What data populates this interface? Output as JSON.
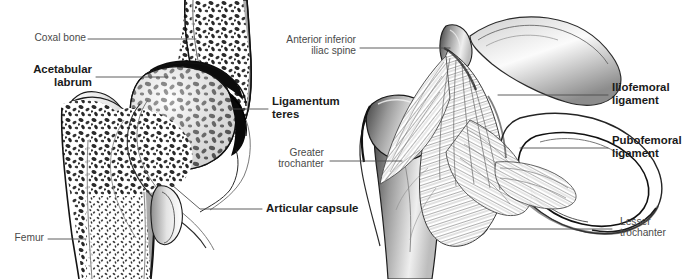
{
  "figure": {
    "background_color": "#ffffff",
    "ink_color": "#231f20",
    "leader_color": "#5a5a5a",
    "panels": [
      {
        "name": "coronal-section",
        "caption": "Coronal section through the hip joint showing trabecular bone"
      },
      {
        "name": "anterior-view",
        "caption": "Anterior view of the hip joint showing capsular ligaments"
      }
    ]
  },
  "labels": {
    "coxal_bone": "Coxal bone",
    "acetabular_labrum": "Acetabular\nlabrum",
    "femur": "Femur",
    "articular_capsule": "Articular capsule",
    "ligamentum_teres": "Ligamentum\nteres",
    "anterior_inferior_iliac_spine": "Anterior inferior\niliac spine",
    "greater_trochanter": "Greater\ntrochanter",
    "iliofemoral_ligament": "Iliofemoral\nligament",
    "pubofemoral_ligament": "Pubofemoral\nligament",
    "lesser_trochanter": "Lesser\ntrochanter"
  }
}
